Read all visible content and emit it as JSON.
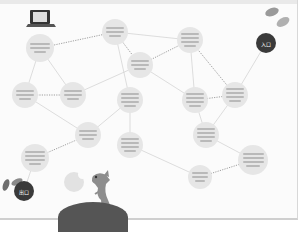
{
  "diagram": {
    "type": "flow-maze",
    "start_label": "入口",
    "end_label": "出口",
    "node_count": 13,
    "nodes": [
      {
        "id": "n1",
        "lines": 3,
        "x": 40,
        "y": 48,
        "r": 14
      },
      {
        "id": "n2",
        "lines": 3,
        "x": 115,
        "y": 32,
        "r": 13
      },
      {
        "id": "n3",
        "lines": 3,
        "x": 25,
        "y": 95,
        "r": 13
      },
      {
        "id": "n4",
        "lines": 3,
        "x": 73,
        "y": 95,
        "r": 13
      },
      {
        "id": "n5",
        "lines": 3,
        "x": 140,
        "y": 65,
        "r": 13
      },
      {
        "id": "n6",
        "lines": 4,
        "x": 190,
        "y": 40,
        "r": 13
      },
      {
        "id": "n7",
        "lines": 4,
        "x": 130,
        "y": 100,
        "r": 13
      },
      {
        "id": "n8",
        "lines": 4,
        "x": 195,
        "y": 100,
        "r": 13
      },
      {
        "id": "n9",
        "lines": 4,
        "x": 235,
        "y": 95,
        "r": 13
      },
      {
        "id": "n10",
        "lines": 3,
        "x": 88,
        "y": 135,
        "r": 13
      },
      {
        "id": "n11",
        "lines": 4,
        "x": 35,
        "y": 158,
        "r": 14
      },
      {
        "id": "n12",
        "lines": 4,
        "x": 130,
        "y": 145,
        "r": 13
      },
      {
        "id": "n13",
        "lines": 4,
        "x": 206,
        "y": 135,
        "r": 13
      },
      {
        "id": "n14",
        "lines": 4,
        "x": 253,
        "y": 160,
        "r": 15
      },
      {
        "id": "n15",
        "lines": 3,
        "x": 200,
        "y": 177,
        "r": 12
      }
    ],
    "edges": [
      [
        "n1",
        "n2"
      ],
      [
        "n1",
        "n3"
      ],
      [
        "n1",
        "n4"
      ],
      [
        "n2",
        "n5"
      ],
      [
        "n2",
        "n6"
      ],
      [
        "n2",
        "n7"
      ],
      [
        "n3",
        "n4"
      ],
      [
        "n3",
        "n10"
      ],
      [
        "n4",
        "n5"
      ],
      [
        "n5",
        "n6"
      ],
      [
        "n5",
        "n8"
      ],
      [
        "n6",
        "n8"
      ],
      [
        "n6",
        "n9"
      ],
      [
        "n7",
        "n10"
      ],
      [
        "n7",
        "n12"
      ],
      [
        "n8",
        "n9"
      ],
      [
        "n8",
        "n13"
      ],
      [
        "n9",
        "n13"
      ],
      [
        "n10",
        "n11"
      ],
      [
        "n12",
        "n15"
      ],
      [
        "n13",
        "n14"
      ],
      [
        "n14",
        "n15"
      ],
      [
        "n11",
        "start"
      ],
      [
        "n9",
        "end"
      ]
    ],
    "edge_label": "YES/NO"
  },
  "decor": {
    "laptop_icon": "laptop-icon",
    "slippers_icon": "slippers-icon",
    "shoes_icon": "shoes-icon",
    "dog_icon": "dog-icon",
    "moon_icon": "moon-icon"
  }
}
